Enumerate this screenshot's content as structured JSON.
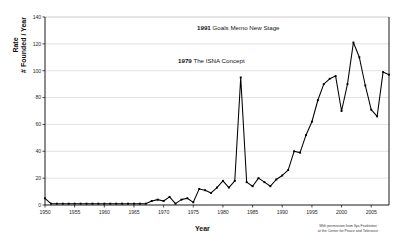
{
  "chart_data": {
    "type": "line",
    "title": "",
    "xlabel": "Year",
    "ylabel_top": "Rate",
    "ylabel_bottom": "# Founded / Year",
    "xlim": [
      1950,
      2008
    ],
    "ylim": [
      0,
      140
    ],
    "ytick_step": 20,
    "xtick_step": 5,
    "grid": true,
    "legend": "none",
    "marker": "square",
    "line_color": "#000000",
    "grid_color": "#cfcfcf",
    "yticks": [
      0,
      20,
      40,
      60,
      80,
      100,
      120,
      140
    ],
    "xticks": [
      1950,
      1955,
      1960,
      1965,
      1970,
      1975,
      1980,
      1985,
      1990,
      1995,
      2000,
      2005
    ],
    "x": [
      1950,
      1951,
      1952,
      1953,
      1954,
      1955,
      1956,
      1957,
      1958,
      1959,
      1960,
      1961,
      1962,
      1963,
      1964,
      1965,
      1966,
      1967,
      1968,
      1969,
      1970,
      1971,
      1972,
      1973,
      1974,
      1975,
      1976,
      1977,
      1978,
      1979,
      1980,
      1981,
      1982,
      1983,
      1984,
      1985,
      1986,
      1987,
      1988,
      1989,
      1990,
      1991,
      1992,
      1993,
      1994,
      1995,
      1996,
      1997,
      1998,
      1999,
      2000,
      2001,
      2002,
      2003,
      2004,
      2005,
      2006,
      2007,
      2008
    ],
    "values": [
      5,
      1,
      1,
      1,
      1,
      1,
      1,
      1,
      1,
      1,
      1,
      1,
      1,
      1,
      1,
      1,
      1,
      1,
      3,
      4,
      3,
      6,
      1,
      4,
      5,
      2,
      12,
      11,
      9,
      13,
      18,
      13,
      18,
      95,
      17,
      14,
      20,
      17,
      14,
      19,
      22,
      26,
      40,
      39,
      52,
      62,
      78,
      90,
      94,
      96,
      70,
      90,
      121,
      110,
      89,
      71,
      66,
      99,
      97
    ],
    "annotations": [
      {
        "year_label": "1991",
        "text": "Goals Memo New Stage"
      },
      {
        "year_label": "1979",
        "text": "The ISNA Concept"
      }
    ],
    "credit_line_1": "With permission from Ilya Feoktistov",
    "credit_line_2": "at the Center for Peace and Tolerance"
  }
}
